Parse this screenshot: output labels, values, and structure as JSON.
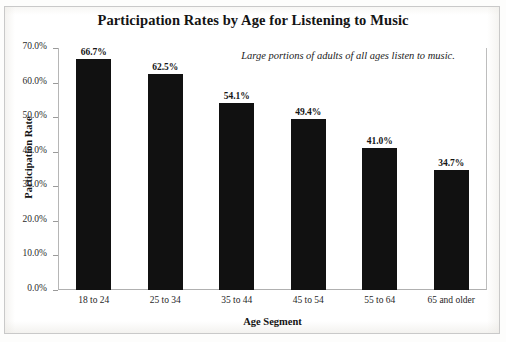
{
  "chart_data": {
    "type": "bar",
    "title": "Participation Rates by Age for Listening to Music",
    "xlabel": "Age Segment",
    "ylabel": "Participation Rate",
    "categories": [
      "18 to 24",
      "25 to 34",
      "35 to 44",
      "45 to 54",
      "55 to 64",
      "65 and older"
    ],
    "values": [
      66.7,
      62.5,
      54.1,
      49.4,
      41.0,
      34.7
    ],
    "value_labels": [
      "66.7%",
      "62.5%",
      "54.1%",
      "49.4%",
      "41.0%",
      "34.7%"
    ],
    "ylim": [
      0,
      70
    ],
    "ytick_values": [
      0,
      10,
      20,
      30,
      40,
      50,
      60,
      70
    ],
    "ytick_labels": [
      "0.0%",
      "10.0%",
      "20.0%",
      "30.0%",
      "40.0%",
      "50.0%",
      "60.0%",
      "70.0%"
    ],
    "grid": false,
    "legend": "none",
    "bar_color": "#111111",
    "annotations": [
      "Large portions of adults of all ages listen to music."
    ]
  }
}
